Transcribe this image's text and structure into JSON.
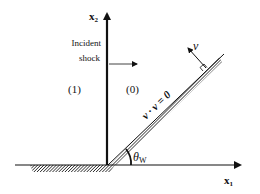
{
  "diagram": {
    "axes": {
      "x1_label": "x",
      "x1_sub": "1",
      "x2_label": "x",
      "x2_sub": "2"
    },
    "incident_shock": {
      "label_line1": "Incident",
      "label_line2": "shock"
    },
    "regions": {
      "left": "(1)",
      "right": "(0)"
    },
    "wedge": {
      "boundary_condition": "v · ν = 0",
      "normal_label": "ν",
      "angle_symbol": "θ",
      "angle_sub": "W"
    },
    "colors": {
      "line": "#111111",
      "hatch": "#222222",
      "background": "#ffffff"
    }
  }
}
